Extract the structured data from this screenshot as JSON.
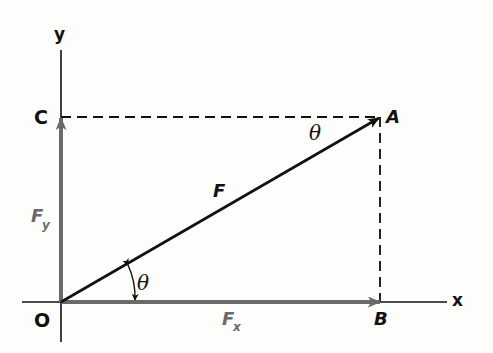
{
  "diagram": {
    "axes": {
      "x_label": "x",
      "y_label": "y"
    },
    "points": {
      "origin": "O",
      "tip": "A",
      "x_foot": "B",
      "y_foot": "C"
    },
    "vectors": {
      "resultant": "F",
      "x_component": {
        "symbol": "F",
        "subscript": "x"
      },
      "y_component": {
        "symbol": "F",
        "subscript": "y"
      }
    },
    "angles": {
      "at_origin": "θ",
      "at_tip": "θ"
    },
    "colors": {
      "line": "#111111",
      "component": "#6a6a6a",
      "background": "#fdfdfc"
    }
  }
}
